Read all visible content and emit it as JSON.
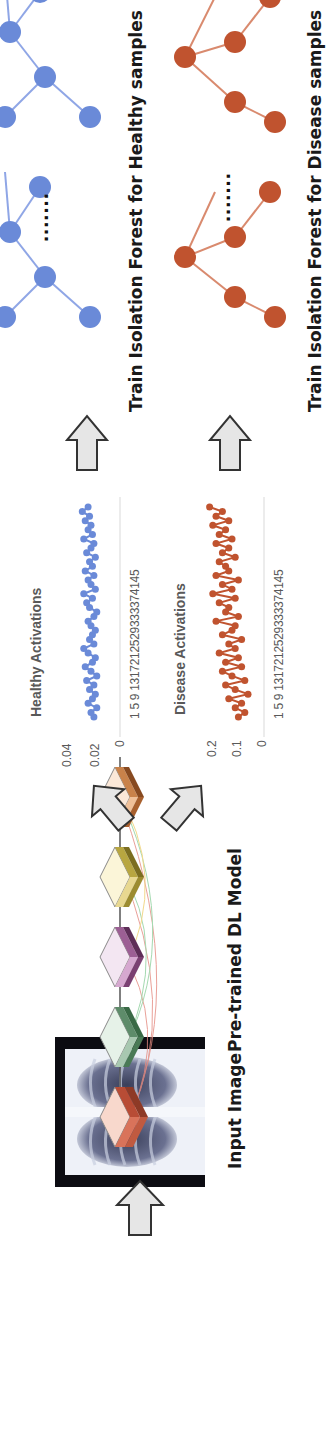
{
  "diagram": {
    "orientation": "rotated -90deg (reads bottom-to-top)",
    "stages": {
      "input": {
        "label": "Input Image"
      },
      "model": {
        "label": "Pre-trained DL Model",
        "layer_colors": [
          "#d9735a",
          "#5e8c6a",
          "#9c5f94",
          "#b8a640",
          "#c9824a"
        ]
      },
      "healthy_chart": {
        "title": "Healthy Activations",
        "y_ticks": [
          "0.04",
          "0.02",
          "0"
        ],
        "x_ticks": "1  5  9 1317212529333374145",
        "color": "#6a8ad8"
      },
      "disease_chart": {
        "title": "Disease Activations",
        "y_ticks": [
          "0.2",
          "0.1",
          "0"
        ],
        "x_ticks": "1  5  9 1317212529333374145",
        "color": "#c0532f"
      },
      "healthy_forest": {
        "label": "Train Isolation Forest for Healthy samples",
        "color": "#6a8ad8",
        "ellipsis": "......."
      },
      "disease_forest": {
        "label": "Train Isolation Forest for Disease samples",
        "color": "#c0532f",
        "ellipsis": "......."
      }
    }
  },
  "chart_data": [
    {
      "type": "line",
      "title": "Healthy Activations",
      "xlabel": "",
      "ylabel": "",
      "x_tick_labels": [
        "1",
        "5",
        "9",
        "13",
        "17",
        "21",
        "25",
        "29",
        "33",
        "37",
        "41",
        "45"
      ],
      "ylim": [
        0,
        0.04
      ],
      "y_ticks": [
        0,
        0.02,
        0.04
      ],
      "series": [
        {
          "name": "Healthy",
          "color": "#6a8ad8",
          "values": [
            0.018,
            0.02,
            0.016,
            0.022,
            0.019,
            0.017,
            0.021,
            0.018,
            0.023,
            0.016,
            0.02,
            0.024,
            0.019,
            0.017,
            0.022,
            0.025,
            0.018,
            0.021,
            0.019,
            0.017,
            0.02,
            0.022,
            0.018,
            0.016,
            0.021,
            0.023,
            0.019,
            0.025,
            0.017,
            0.02,
            0.022,
            0.018,
            0.024,
            0.019,
            0.021,
            0.017,
            0.023,
            0.02,
            0.018,
            0.025,
            0.019,
            0.022,
            0.02,
            0.024,
            0.021,
            0.026,
            0.022
          ]
        }
      ]
    },
    {
      "type": "line",
      "title": "Disease Activations",
      "xlabel": "",
      "ylabel": "",
      "x_tick_labels": [
        "1",
        "5",
        "9",
        "13",
        "17",
        "21",
        "25",
        "29",
        "33",
        "37",
        "41",
        "45"
      ],
      "ylim": [
        0,
        0.2
      ],
      "y_ticks": [
        0,
        0.1,
        0.2
      ],
      "series": [
        {
          "name": "Disease",
          "color": "#c0532f",
          "values": [
            0.08,
            0.06,
            0.09,
            0.07,
            0.11,
            0.05,
            0.09,
            0.12,
            0.06,
            0.1,
            0.13,
            0.07,
            0.12,
            0.08,
            0.14,
            0.09,
            0.11,
            0.07,
            0.13,
            0.1,
            0.09,
            0.15,
            0.08,
            0.12,
            0.11,
            0.14,
            0.09,
            0.16,
            0.1,
            0.13,
            0.08,
            0.15,
            0.11,
            0.12,
            0.14,
            0.09,
            0.13,
            0.11,
            0.15,
            0.1,
            0.14,
            0.12,
            0.16,
            0.11,
            0.15,
            0.13,
            0.17
          ]
        }
      ]
    }
  ]
}
